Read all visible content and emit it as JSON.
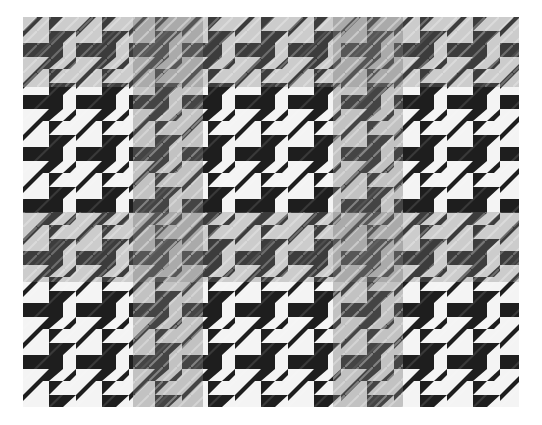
{
  "image": {
    "subject": "houndstooth fabric swatch with gray overcheck",
    "heading_fragment": "",
    "colors": {
      "background": "#ffffff",
      "dark": "#1e1e1e",
      "light": "#f4f4f4",
      "overcheck": "#7a7a7a"
    },
    "pattern": {
      "tile_width": 53,
      "tile_height": 52,
      "overcheck_vertical_bands_x": [
        110,
        310
      ],
      "overcheck_band_width": 70,
      "overcheck_horizontal_bands_y": [
        0,
        195
      ],
      "overcheck_band_height": 70
    }
  }
}
